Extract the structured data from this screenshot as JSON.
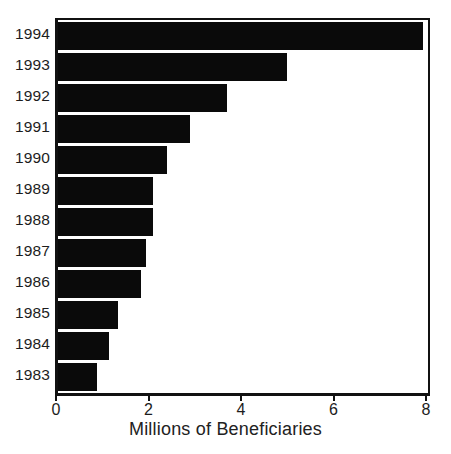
{
  "chart_data": {
    "type": "bar",
    "orientation": "horizontal",
    "title": "",
    "xlabel": "Millions of Beneficiaries",
    "ylabel": "",
    "categories": [
      "1994",
      "1993",
      "1992",
      "1991",
      "1990",
      "1989",
      "1988",
      "1987",
      "1986",
      "1985",
      "1984",
      "1983"
    ],
    "values": [
      7.9,
      4.95,
      3.65,
      2.85,
      2.35,
      2.05,
      2.05,
      1.9,
      1.8,
      1.3,
      1.1,
      0.85
    ],
    "xlim": [
      0,
      8
    ],
    "xticks": [
      0,
      2,
      4,
      6,
      8
    ],
    "xtick_labels": [
      "0",
      "2",
      "4",
      "6",
      "8"
    ],
    "grid": false,
    "legend": null,
    "bar_color": "#0a0a0a",
    "axis_color": "#111111",
    "background": "#ffffff"
  },
  "axis": {
    "x_title": "Millions of Beneficiaries"
  }
}
